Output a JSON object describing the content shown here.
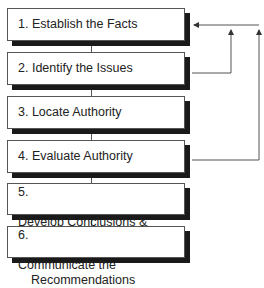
{
  "steps": [
    {
      "number": "1.",
      "label": "Establish the Facts"
    },
    {
      "number": "2.",
      "label": "Identify the Issues"
    },
    {
      "number": "3.",
      "label": "Locate Authority"
    },
    {
      "number": "4.",
      "label": "Evaluate Authority"
    },
    {
      "number": "5.",
      "label": "Develop Conclusions &",
      "label2": "Recommendations"
    },
    {
      "number": "6.",
      "label": "Communicate the",
      "label2": "Recommendations"
    }
  ],
  "feedback_loops": [
    {
      "from": "2. Identify the Issues",
      "to": "1. Establish the Facts"
    },
    {
      "from": "4. Evaluate Authority",
      "to": "1. Establish the Facts"
    }
  ],
  "colors": {
    "border": "#555555",
    "shadow": "#1a1a1a",
    "text": "#222222",
    "background": "#ffffff"
  }
}
